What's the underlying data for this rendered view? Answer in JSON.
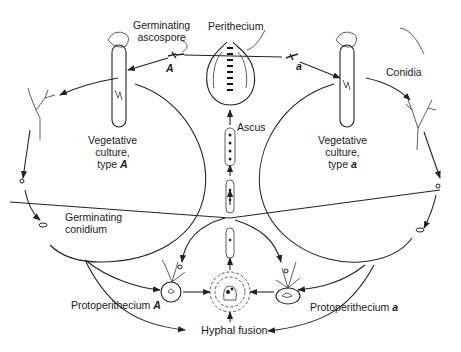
{
  "labels": {
    "germinating_ascospore": [
      "Germinating",
      "ascospore"
    ],
    "perithecium": "Perithecium",
    "conidia": "Conidia",
    "vegetative_culture_A": [
      "Vegetative",
      "culture,",
      "type",
      "A"
    ],
    "vegetative_culture_a": [
      "Vegetative",
      "culture,",
      "type",
      "a"
    ],
    "ascus": "Ascus",
    "germinating_conidium": [
      "Germinating",
      "conidium"
    ],
    "protoperithecium_A": [
      "Protoperithecium",
      "A"
    ],
    "protoperithecium_a": [
      "Protoperithecium",
      "a"
    ],
    "hyphal_fusion": "Hyphal fusion",
    "ascospore_A": "A",
    "ascospore_a": "a"
  }
}
